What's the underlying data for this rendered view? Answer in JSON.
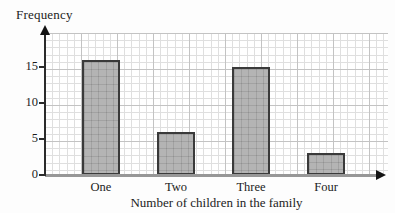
{
  "chart_data": {
    "type": "bar",
    "title": "",
    "ylabel": "Frequency",
    "xlabel": "Number of children in the family",
    "categories": [
      "One",
      "Two",
      "Three",
      "Four"
    ],
    "values": [
      16,
      6,
      15,
      3
    ],
    "yticks": [
      0,
      5,
      10,
      15
    ],
    "ylim": [
      0,
      20
    ],
    "grid": "fine graph-paper grid on, minor step 1 unit, major step 5 units",
    "legend": "none",
    "colors": {
      "bar_fill": "#b4b4b4",
      "bar_border": "#3a3a3a",
      "grid_minor": "#dfdfdf",
      "grid_major": "#c3c3c3",
      "y_axis": "#2b2b2b",
      "x_axis": "#979797",
      "arrow": "#141414",
      "text": "#1c1c1c",
      "background": "#fdfdfd"
    }
  }
}
